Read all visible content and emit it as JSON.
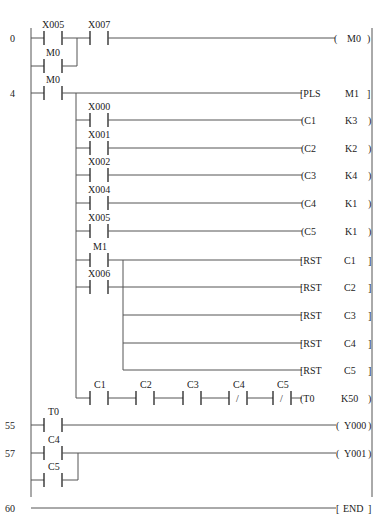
{
  "diagram": {
    "type": "ladder",
    "rungs": [
      {
        "step": "0",
        "contacts": [
          "X005",
          "X007"
        ],
        "parallel": [
          "M0"
        ],
        "output": {
          "open": "(",
          "op": "M0",
          "close": ")"
        }
      },
      {
        "step": "4",
        "contacts": [
          "M0"
        ],
        "output": {
          "open": "[PLS",
          "op": "M1",
          "close": "]"
        }
      },
      {
        "contact": "X000",
        "output": {
          "open": "(C1",
          "op": "K3",
          "close": ")"
        }
      },
      {
        "contact": "X001",
        "output": {
          "open": "(C2",
          "op": "K2",
          "close": ")"
        }
      },
      {
        "contact": "X002",
        "output": {
          "open": "(C3",
          "op": "K4",
          "close": ")"
        }
      },
      {
        "contact": "X004",
        "output": {
          "open": "(C4",
          "op": "K1",
          "close": ")"
        }
      },
      {
        "contact": "X005",
        "output": {
          "open": "(C5",
          "op": "K1",
          "close": ")"
        }
      },
      {
        "contact": "M1",
        "output": {
          "open": "[RST",
          "op": "C1",
          "close": "]"
        }
      },
      {
        "contact": "X006",
        "output": {
          "open": "[RST",
          "op": "C2",
          "close": "]"
        }
      },
      {
        "output": {
          "open": "[RST",
          "op": "C3",
          "close": "]"
        }
      },
      {
        "output": {
          "open": "[RST",
          "op": "C4",
          "close": "]"
        }
      },
      {
        "output": {
          "open": "[RST",
          "op": "C5",
          "close": "]"
        }
      },
      {
        "contacts": [
          "C1",
          "C2",
          "C3",
          "C4",
          "C5"
        ],
        "nc": [
          "C4",
          "C5"
        ],
        "output": {
          "open": "(T0",
          "op": "K50",
          "close": ")"
        }
      },
      {
        "step": "55",
        "contacts": [
          "T0"
        ],
        "output": {
          "open": "(",
          "op": "Y000",
          "close": ")"
        }
      },
      {
        "step": "57",
        "contacts": [
          "C4"
        ],
        "parallel": [
          "C5"
        ],
        "output": {
          "open": "(",
          "op": "Y001",
          "close": ")"
        }
      },
      {
        "step": "60",
        "output": {
          "open": "[",
          "op": "END",
          "close": "]"
        }
      }
    ],
    "nc_mark": "/"
  }
}
